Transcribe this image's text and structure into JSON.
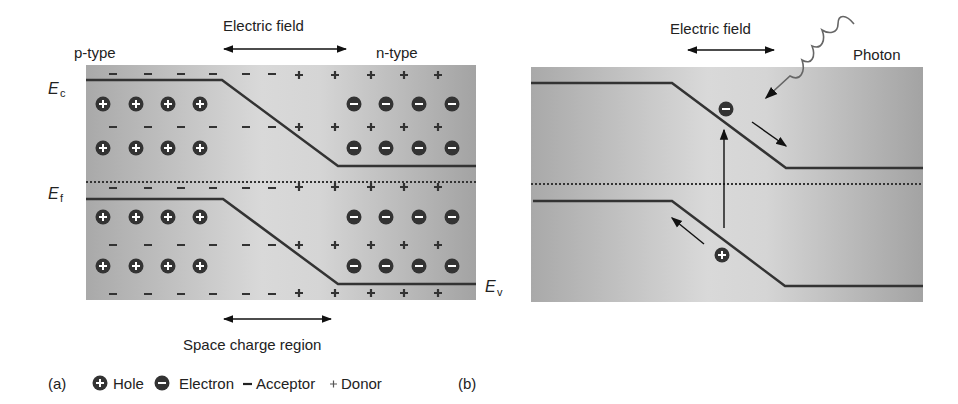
{
  "panel_a": {
    "label": "(a)",
    "electric_field": "Electric field",
    "p_type": "p-type",
    "n_type": "n-type",
    "ec": "E",
    "ec_sub": "c",
    "ef": "E",
    "ef_sub": "f",
    "ev": "E",
    "ev_sub": "v",
    "space_charge": "Space charge region"
  },
  "legend": {
    "hole": "Hole",
    "electron": "Electron",
    "acceptor": "Acceptor",
    "donor": "Donor"
  },
  "panel_b": {
    "label": "(b)",
    "electric_field": "Electric field",
    "photon": "Photon"
  },
  "colors": {
    "band": "#333333",
    "bg_dark": "#a8a8a8",
    "bg_light": "#d8d8d8"
  }
}
